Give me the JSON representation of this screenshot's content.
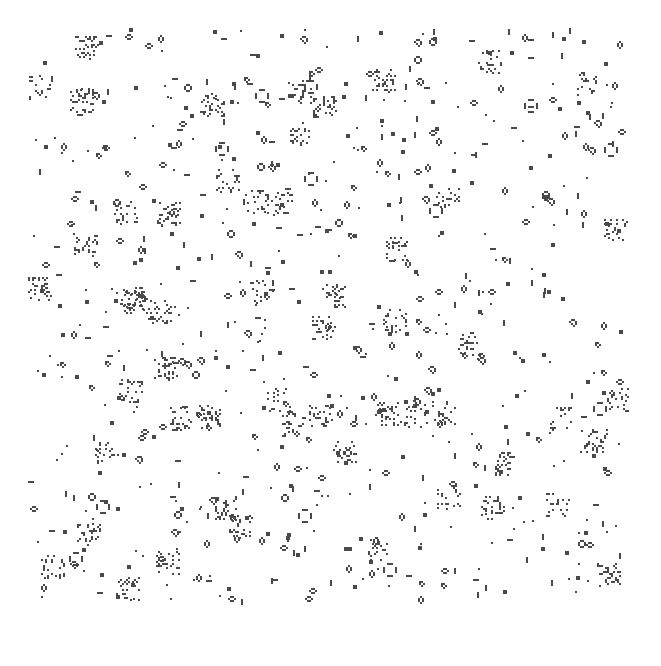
{
  "game": {
    "type": "cellular-automaton",
    "rule": "B3/S23",
    "board": {
      "x": 28,
      "y": 28,
      "width": 608,
      "height": 590,
      "cell_px": 2
    },
    "colors": {
      "background": "#ffffff",
      "live_cell": "#4a4a4a"
    },
    "pattern_counts": {
      "block": 150,
      "blinker": 150,
      "beehive": 85,
      "loaf": 25,
      "boat": 30,
      "traffic_light": 12,
      "pond": 14,
      "single_debris": 200,
      "chaotic_cluster": 55
    },
    "seed": 20240611
  }
}
